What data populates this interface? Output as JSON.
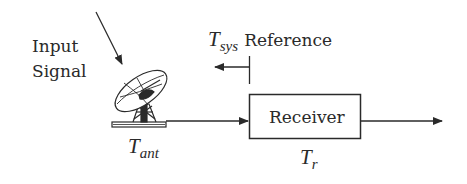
{
  "diagram": {
    "type": "block-diagram",
    "colors": {
      "stroke": "#2a2a2a",
      "background": "#ffffff"
    },
    "input_label": {
      "line1": "Input",
      "line2": "Signal"
    },
    "antenna": {
      "icon": "satellite-dish-icon",
      "temperature": {
        "symbol": "T",
        "subscript": "ant"
      }
    },
    "reference": {
      "symbol": "T",
      "subscript": "sys",
      "text": "Reference"
    },
    "receiver": {
      "label": "Receiver",
      "temperature": {
        "symbol": "T",
        "subscript": "r"
      }
    },
    "connections": [
      {
        "from": "input-signal",
        "to": "antenna"
      },
      {
        "from": "antenna",
        "to": "receiver"
      },
      {
        "from": "receiver",
        "to": "output"
      }
    ]
  }
}
